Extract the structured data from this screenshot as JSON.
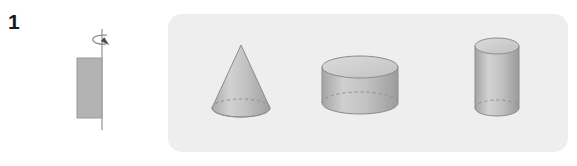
{
  "problem": {
    "number": "1",
    "type": "solid-of-revolution"
  },
  "prompt": {
    "shape_name": "rectangle",
    "axis_name": "vertical-rotation-axis",
    "arrow_name": "rotation-arrow",
    "axis_position": "right-edge-of-rectangle"
  },
  "options": [
    {
      "id": "cone",
      "label": "cone",
      "hidden_edge": "dashed-ellipse"
    },
    {
      "id": "disk",
      "label": "flat cylinder",
      "hidden_edge": "dashed-ellipse"
    },
    {
      "id": "cylinder",
      "label": "tall cylinder",
      "hidden_edge": "dashed-ellipse"
    }
  ],
  "colors": {
    "panel_background": "#eeeeee",
    "page_background": "#ffffff",
    "solid_fill_light": "#d5d5d5",
    "solid_fill_mid": "#b8b8b8",
    "solid_fill_dark": "#9d9d9d",
    "outline": "#8c8c8c",
    "rect_fill": "#b3b3b3",
    "rect_outline": "#999999",
    "axis_line": "#9a9a9a",
    "dashed_line": "#8e8e8e",
    "number_text": "#1a1a1a"
  }
}
